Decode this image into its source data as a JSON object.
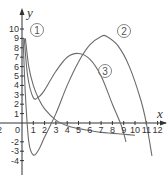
{
  "chart_data": {
    "type": "line",
    "title": "",
    "xlabel": "x",
    "ylabel": "y",
    "xlim": [
      -2,
      12.5
    ],
    "ylim": [
      -4.5,
      10.5
    ],
    "grid": false,
    "x_ticks": [
      "2",
      "0",
      "1",
      "2",
      "3",
      "4",
      "5",
      "6",
      "7",
      "8",
      "9",
      "10",
      "11",
      "12"
    ],
    "x_tick_values": [
      -2,
      0,
      1,
      2,
      3,
      4,
      5,
      6,
      7,
      8,
      9,
      10,
      11,
      12
    ],
    "y_ticks": [
      "10",
      "9",
      "8",
      "7",
      "6",
      "5",
      "4",
      "3",
      "2",
      "1",
      "-2",
      "-3",
      "-4"
    ],
    "y_tick_values": [
      10,
      9,
      8,
      7,
      6,
      5,
      4,
      3,
      2,
      1,
      -2,
      -3,
      -4
    ],
    "origin_label": "0",
    "series": [
      {
        "name": "1",
        "label": "①",
        "description": "decreasing curve from high near y-axis, passes ~(3,0.3), approaching ~-1.3 near x=10",
        "points": [
          [
            0.3,
            9
          ],
          [
            0.6,
            6
          ],
          [
            1,
            4
          ],
          [
            1.5,
            2.5
          ],
          [
            2,
            1.5
          ],
          [
            3,
            0.3
          ],
          [
            4,
            -0.3
          ],
          [
            5,
            -0.6
          ],
          [
            6,
            -0.8
          ],
          [
            7,
            -1
          ],
          [
            8,
            -1.1
          ],
          [
            9,
            -1.2
          ],
          [
            10,
            -1.3
          ]
        ]
      },
      {
        "name": "2",
        "label": "②",
        "description": "starts near top at y-axis, dips to min ~(1,-3.4), rises to max ~(7.5,9.2), falls through ~(11,0) to ~-4",
        "points": [
          [
            0.1,
            9
          ],
          [
            0.3,
            3
          ],
          [
            0.6,
            -2
          ],
          [
            1,
            -3.4
          ],
          [
            1.5,
            -2.8
          ],
          [
            2,
            -1.5
          ],
          [
            3,
            1
          ],
          [
            4,
            4
          ],
          [
            5,
            6.5
          ],
          [
            6,
            8.3
          ],
          [
            7,
            9.2
          ],
          [
            7.5,
            9.2
          ],
          [
            8.5,
            8.2
          ],
          [
            9.5,
            6
          ],
          [
            10.5,
            2.5
          ],
          [
            11,
            0
          ],
          [
            11.5,
            -3.5
          ]
        ]
      },
      {
        "name": "3",
        "label": "③",
        "description": "from high near y-axis, min ~(1,2.7), max ~(5,7.4), descends to ~(9,-2)",
        "points": [
          [
            0.2,
            9
          ],
          [
            0.5,
            5
          ],
          [
            1,
            2.7
          ],
          [
            1.5,
            2.8
          ],
          [
            2,
            3.5
          ],
          [
            3,
            5.5
          ],
          [
            4,
            7
          ],
          [
            5,
            7.4
          ],
          [
            6,
            6.8
          ],
          [
            7,
            5
          ],
          [
            8,
            2
          ],
          [
            8.8,
            -0.3
          ],
          [
            9.2,
            -2
          ]
        ]
      }
    ]
  }
}
